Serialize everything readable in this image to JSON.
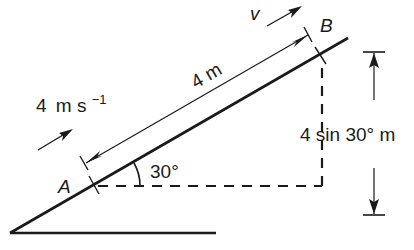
{
  "diagram": {
    "type": "inclined-plane",
    "angle_label": "30°",
    "angle_degrees": 30,
    "point_a_label": "A",
    "point_b_label": "B",
    "length_label": "4 m",
    "height_label": "4 sin 30° m",
    "initial_speed": {
      "value": "4",
      "unit": "m s",
      "exponent": "−1"
    },
    "final_velocity_label": "v",
    "colors": {
      "line": "#1a1a1a",
      "background": "#ffffff"
    }
  }
}
